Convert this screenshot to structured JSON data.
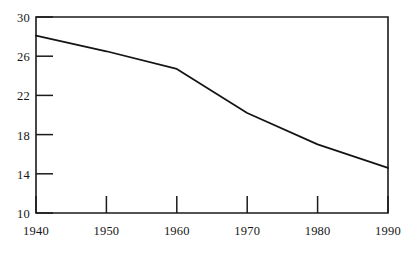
{
  "chart_data": {
    "type": "line",
    "title": "",
    "subtitle": "",
    "xlabel": "",
    "ylabel": "",
    "x": [
      1940,
      1950,
      1960,
      1970,
      1980,
      1990
    ],
    "series": [
      {
        "name": "series-1",
        "values": [
          28.1,
          26.5,
          24.7,
          20.2,
          17.0,
          14.6
        ]
      }
    ],
    "xlim": [
      1940,
      1990
    ],
    "ylim": [
      10,
      30
    ],
    "x_ticks": [
      1940,
      1950,
      1960,
      1970,
      1980,
      1990
    ],
    "x_tick_labels": [
      "1940",
      "1950",
      "1960",
      "1970",
      "1980",
      "1990"
    ],
    "y_ticks": [
      10,
      14,
      18,
      22,
      26,
      30
    ],
    "y_tick_labels": [
      "10",
      "14",
      "18",
      "22",
      "26",
      "30"
    ],
    "grid": false,
    "legend": "none",
    "tick_direction": "in",
    "line_color": "#141414",
    "frame_color": "#1b1b1b",
    "background_color": "#ffffff",
    "annotations": []
  },
  "axes": {
    "y_tick_labels": {
      "t30": "30",
      "t26": "26",
      "t22": "22",
      "t18": "18",
      "t14": "14",
      "t10": "10"
    },
    "x_tick_labels": {
      "t1940": "1940",
      "t1950": "1950",
      "t1960": "1960",
      "t1970": "1970",
      "t1980": "1980",
      "t1990": "1990"
    }
  }
}
